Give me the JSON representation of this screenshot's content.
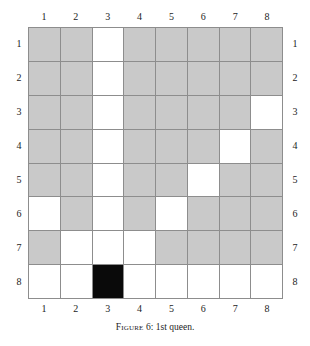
{
  "figure": {
    "caption_prefix": "Figure",
    "caption_number": "6",
    "caption_separator": ":",
    "caption_text": "1st queen.",
    "caption_full": "FIGURE 6: 1st queen."
  },
  "board": {
    "rows": 8,
    "columns": 8,
    "column_labels_top": [
      "1",
      "2",
      "3",
      "4",
      "5",
      "6",
      "7",
      "8"
    ],
    "column_labels_bottom": [
      "1",
      "2",
      "3",
      "4",
      "5",
      "6",
      "7",
      "8"
    ],
    "row_labels_left": [
      "1",
      "2",
      "3",
      "4",
      "5",
      "6",
      "7",
      "8"
    ],
    "row_labels_right": [
      "1",
      "2",
      "3",
      "4",
      "5",
      "6",
      "7",
      "8"
    ],
    "queen_position": {
      "row": 8,
      "column": 3
    },
    "colors": {
      "shaded": "#c9c9c9",
      "free": "#ffffff",
      "queen": "#0a0a0a",
      "gridline": "#8d8d8d",
      "text": "#1c1c1c",
      "background": "#ffffff"
    },
    "legend": {
      "shaded_meaning": "free square",
      "white_meaning": "attacked square",
      "black_meaning": "queen"
    }
  },
  "chart_data": {
    "type": "heatmap",
    "xlabel": "",
    "ylabel": "",
    "categories_x": [
      "1",
      "2",
      "3",
      "4",
      "5",
      "6",
      "7",
      "8"
    ],
    "categories_y": [
      "1",
      "2",
      "3",
      "4",
      "5",
      "6",
      "7",
      "8"
    ],
    "value_legend": {
      "0": "shaded",
      "1": "white",
      "2": "queen"
    },
    "grid": true,
    "legend_position": "none",
    "cells": [
      [
        0,
        0,
        1,
        0,
        0,
        0,
        0,
        0
      ],
      [
        0,
        0,
        1,
        0,
        0,
        0,
        0,
        0
      ],
      [
        0,
        0,
        1,
        0,
        0,
        0,
        0,
        1
      ],
      [
        0,
        0,
        1,
        0,
        0,
        0,
        1,
        0
      ],
      [
        0,
        0,
        1,
        0,
        0,
        1,
        0,
        0
      ],
      [
        1,
        0,
        1,
        0,
        1,
        0,
        0,
        0
      ],
      [
        0,
        1,
        1,
        1,
        0,
        0,
        0,
        0
      ],
      [
        1,
        1,
        2,
        1,
        1,
        1,
        1,
        1
      ]
    ]
  }
}
